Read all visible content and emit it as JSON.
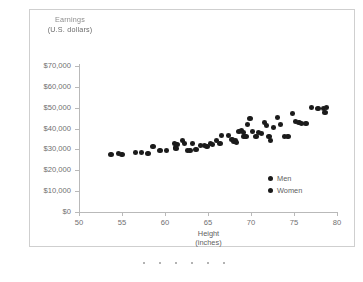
{
  "chart_data": {
    "type": "scatter",
    "title": "",
    "ylabel_line1": "Earnings",
    "ylabel_line2": "(U.S. dollars)",
    "xlabel_line1": "Height",
    "xlabel_line2": "(inches)",
    "xlim": [
      50,
      80
    ],
    "ylim": [
      0,
      70000
    ],
    "xticks": [
      50,
      55,
      60,
      65,
      70,
      75,
      80
    ],
    "xtick_labels": [
      "50",
      "55",
      "60",
      "65",
      "70",
      "75",
      "80"
    ],
    "yticks": [
      0,
      10000,
      20000,
      30000,
      40000,
      50000,
      60000,
      70000
    ],
    "ytick_labels": [
      "$0",
      "$10,000",
      "$20,000",
      "$30,000",
      "$40,000",
      "$50,000",
      "$60,000",
      "$70,000"
    ],
    "grid": false,
    "legend_position": "inside-lower-right",
    "marker_color": "#1b1b1b",
    "series": [
      {
        "name": "Men",
        "marker": "filled-circle",
        "color": "#1b1b1b"
      },
      {
        "name": "Women",
        "marker": "filled-circle",
        "color": "#1b1b1b"
      }
    ],
    "points": [
      [
        53.7,
        27800
      ],
      [
        54.6,
        28100
      ],
      [
        55.0,
        27400
      ],
      [
        56.6,
        28600
      ],
      [
        57.3,
        28600
      ],
      [
        58.0,
        28100
      ],
      [
        58.6,
        31600
      ],
      [
        59.4,
        29400
      ],
      [
        60.2,
        29400
      ],
      [
        61.1,
        33000
      ],
      [
        61.2,
        31000
      ],
      [
        61.3,
        30300
      ],
      [
        61.4,
        32200
      ],
      [
        62.0,
        34300
      ],
      [
        62.3,
        33000
      ],
      [
        62.6,
        29400
      ],
      [
        62.9,
        29700
      ],
      [
        63.2,
        32800
      ],
      [
        63.6,
        29900
      ],
      [
        64.1,
        31800
      ],
      [
        64.6,
        32000
      ],
      [
        64.9,
        31400
      ],
      [
        65.3,
        33000
      ],
      [
        65.5,
        32500
      ],
      [
        66.0,
        34100
      ],
      [
        66.4,
        33000
      ],
      [
        66.6,
        36600
      ],
      [
        67.4,
        36900
      ],
      [
        67.8,
        34700
      ],
      [
        68.0,
        34000
      ],
      [
        68.2,
        34100
      ],
      [
        68.3,
        33400
      ],
      [
        68.6,
        38400
      ],
      [
        68.9,
        39200
      ],
      [
        69.1,
        38000
      ],
      [
        69.2,
        36200
      ],
      [
        69.4,
        36200
      ],
      [
        69.6,
        41900
      ],
      [
        69.9,
        44900
      ],
      [
        70.2,
        38400
      ],
      [
        70.6,
        36300
      ],
      [
        70.9,
        38300
      ],
      [
        71.2,
        37800
      ],
      [
        71.6,
        43100
      ],
      [
        71.8,
        41400
      ],
      [
        72.1,
        36300
      ],
      [
        72.3,
        34100
      ],
      [
        72.6,
        40300
      ],
      [
        73.1,
        45500
      ],
      [
        73.4,
        41900
      ],
      [
        73.9,
        36200
      ],
      [
        74.3,
        36300
      ],
      [
        74.8,
        47000
      ],
      [
        75.2,
        43300
      ],
      [
        75.6,
        43000
      ],
      [
        75.9,
        42600
      ],
      [
        76.4,
        42400
      ],
      [
        77.0,
        50200
      ],
      [
        77.8,
        49700
      ],
      [
        78.4,
        49800
      ],
      [
        78.6,
        47900
      ],
      [
        78.8,
        49900
      ]
    ]
  },
  "legend": {
    "items": [
      {
        "label": "Men"
      },
      {
        "label": "Women"
      }
    ]
  },
  "footer": {
    "dots": 6
  }
}
